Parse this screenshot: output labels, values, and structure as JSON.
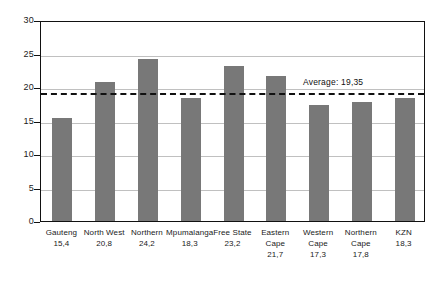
{
  "chart_data": {
    "type": "bar",
    "title": "",
    "subtitle": "",
    "xlabel": "",
    "ylabel": "",
    "ylim": [
      0,
      30
    ],
    "ytick_step": 5,
    "yticks": [
      "0",
      "5",
      "10",
      "15",
      "20",
      "25",
      "30"
    ],
    "grid": true,
    "legend": "none",
    "categories": [
      "Gauteng",
      "North West",
      "Northern",
      "Mpumalanga",
      "Free State",
      "Eastern Cape",
      "Western Cape",
      "Northern Cape",
      "KZN"
    ],
    "category_lines": [
      [
        "Gauteng"
      ],
      [
        "North West"
      ],
      [
        "Northern"
      ],
      [
        "Mpumalanga"
      ],
      [
        "Free State"
      ],
      [
        "Eastern",
        "Cape"
      ],
      [
        "Western",
        "Cape"
      ],
      [
        "Northern",
        "Cape"
      ],
      [
        "KZN"
      ]
    ],
    "values": [
      15.4,
      20.8,
      24.2,
      18.3,
      23.2,
      21.7,
      17.3,
      17.8,
      18.3
    ],
    "value_labels": [
      "15,4",
      "20,8",
      "24,2",
      "18,3",
      "23,2",
      "21,7",
      "17,3",
      "17,8",
      "18,3"
    ],
    "annotations": [
      {
        "name": "average-line",
        "type": "hline",
        "value": 19.35,
        "label": "Average: 19,35",
        "style": "dashed"
      }
    ],
    "colors": {
      "bar": "#787878",
      "axis": "#111111",
      "grid": "#8c8c8c",
      "annotation": "#111111",
      "background": "#ffffff"
    }
  }
}
